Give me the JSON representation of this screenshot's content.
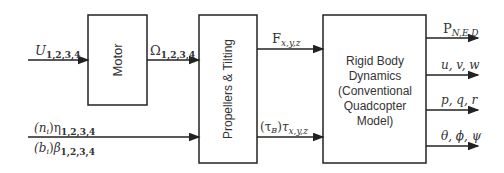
{
  "blocks": {
    "motor": "Motor",
    "propellers": "Propellers & Tilting",
    "rigid_body": [
      "Rigid Body",
      "Dynamics",
      "(Conventional",
      "Quadcopter",
      "Model)"
    ]
  },
  "inputs": {
    "u": {
      "main": "U",
      "sub": "1,2,3,4"
    },
    "eta": {
      "prefix": "(n",
      "prefix_sub": "i",
      "prefix_close": ")",
      "main": "η",
      "sub": "1,2,3,4"
    },
    "beta": {
      "prefix": "(b",
      "prefix_sub": "i",
      "prefix_close": ")",
      "main": "β",
      "sub": "1,2,3,4"
    }
  },
  "signals": {
    "omega": {
      "main": "Ω",
      "sub": "1,2,3,4"
    },
    "force": {
      "main": "F",
      "sub": "x,y,z"
    },
    "torque": {
      "prefix": "(τ",
      "prefix_sub": "B",
      "prefix_close": ")",
      "main": "τ",
      "sub": "x,y,z"
    }
  },
  "outputs": [
    {
      "main": "P",
      "sub": "N,E,D"
    },
    {
      "main": "u, v, w",
      "sub": ""
    },
    {
      "main": "p, q, r",
      "sub": ""
    },
    {
      "main": "θ, ϕ, ψ",
      "sub": ""
    }
  ],
  "colors": {
    "line": "#222222",
    "text": "#333333"
  }
}
